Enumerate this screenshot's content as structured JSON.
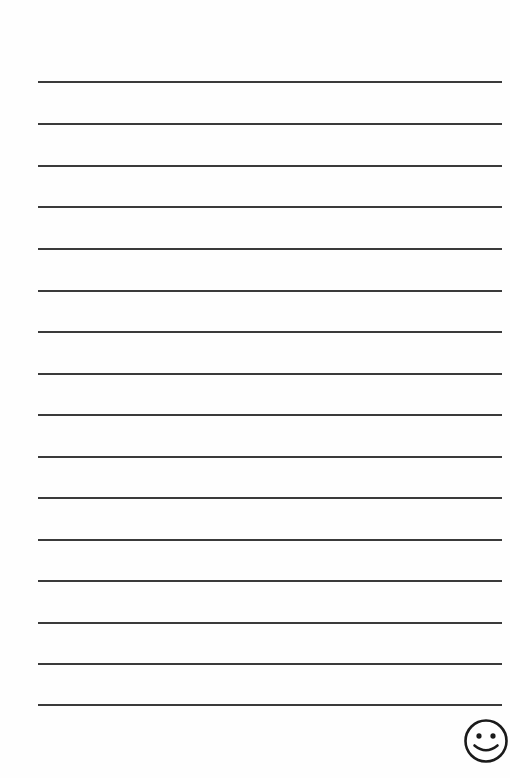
{
  "page": {
    "type": "lined writing paper",
    "background_color": "#fefefe",
    "line_color": "#3a3a3a",
    "line_count": 16,
    "line_positions_y": [
      82,
      124,
      166,
      207,
      249,
      291,
      332,
      374,
      415,
      457,
      498,
      540,
      581,
      623,
      664,
      705
    ],
    "line_left_x": 38,
    "line_right_x": 502
  },
  "decoration": {
    "icon": "smiley-face-icon"
  }
}
